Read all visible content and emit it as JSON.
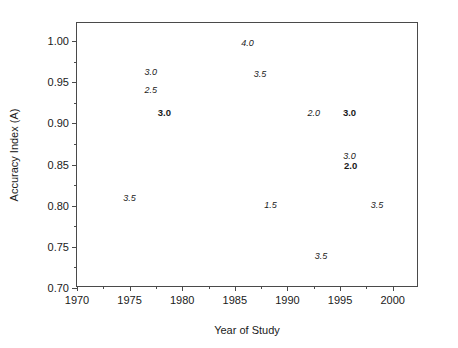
{
  "chart_data": {
    "type": "scatter",
    "title": "",
    "xlabel": "Year of Study",
    "ylabel": "Accuracy Index (A)",
    "xlim": [
      1970,
      2002.5
    ],
    "ylim": [
      0.7,
      1.022
    ],
    "grid": false,
    "legend": null,
    "note": "Each data point is drawn as its numeric value label rather than a marker. Italic labels are one group; bold labels are a second group.",
    "xticks": [
      1970,
      1975,
      1980,
      1985,
      1990,
      1995,
      2000
    ],
    "xticklabels": [
      "1970",
      "1975",
      "1980",
      "1985",
      "1990",
      "1995",
      "2000"
    ],
    "xminorticks": [
      1972.5,
      1977.5,
      1982.5,
      1987.5,
      1992.5,
      1997.5
    ],
    "yticks": [
      0.7,
      0.75,
      0.8,
      0.85,
      0.9,
      0.95,
      1.0
    ],
    "yticklabels": [
      "0.70",
      "0.75",
      "0.80",
      "0.85",
      "0.90",
      "0.95",
      "1.00"
    ],
    "yminorticks": [
      0.725,
      0.775,
      0.825,
      0.875,
      0.925,
      0.975
    ],
    "series": [
      {
        "name": "italic-group",
        "style": "italic",
        "points": [
          {
            "label": "3.0",
            "x": 1977.0,
            "y": 0.963
          },
          {
            "label": "2.5",
            "x": 1977.0,
            "y": 0.941
          },
          {
            "label": "3.5",
            "x": 1975.0,
            "y": 0.809
          },
          {
            "label": "4.0",
            "x": 1986.2,
            "y": 0.998
          },
          {
            "label": "3.5",
            "x": 1987.4,
            "y": 0.96
          },
          {
            "label": "2.0",
            "x": 1992.5,
            "y": 0.913
          },
          {
            "label": "3.0",
            "x": 1995.9,
            "y": 0.86
          },
          {
            "label": "1.5",
            "x": 1988.4,
            "y": 0.801
          },
          {
            "label": "3.5",
            "x": 1998.5,
            "y": 0.801
          },
          {
            "label": "3.5",
            "x": 1993.2,
            "y": 0.739
          }
        ]
      },
      {
        "name": "bold-group",
        "style": "bold",
        "points": [
          {
            "label": "3.0",
            "x": 1978.3,
            "y": 0.913
          },
          {
            "label": "3.0",
            "x": 1995.9,
            "y": 0.913
          },
          {
            "label": "2.0",
            "x": 1996.0,
            "y": 0.848
          }
        ]
      }
    ]
  }
}
